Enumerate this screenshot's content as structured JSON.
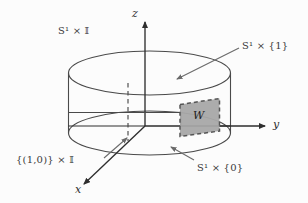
{
  "figure": {
    "kind": "math-diagram",
    "background_color": "#fcfcfc",
    "line_color": "#4a4a4a",
    "axis_color": "#2e2e2e",
    "shade_fill": "#a8a8a8",
    "shade_stroke": "#555555"
  },
  "axes": {
    "x_label": "x",
    "y_label": "y",
    "z_label": "z"
  },
  "labels": {
    "cylinder": "S¹ × 𝕀",
    "cylinder_parts": {
      "base": "S",
      "sup": "1",
      "times": "×",
      "interval": "𝕀"
    },
    "top_circle": "S¹ × {1}",
    "bottom_circle": "S¹ × {0}",
    "fiber": "{(1,0)} × 𝕀",
    "shaded_region": "W"
  },
  "glyphs": {
    "blackboard_S": "𝕊",
    "blackboard_I": "𝕀",
    "superscript_one": "1",
    "times": "×",
    "set_one": "{1}",
    "set_zero": "{0}",
    "point": "{(1,0)}"
  }
}
